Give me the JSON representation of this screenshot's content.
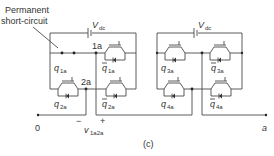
{
  "annotation": {
    "line1": "Permanent",
    "line2": "short-circuit"
  },
  "left_bridge": {
    "source_label": "V",
    "source_sub": "dc",
    "node_top": "1a",
    "node_mid": "2a",
    "switches": [
      {
        "label": "q",
        "sub": "1a",
        "bar": false
      },
      {
        "label": "q",
        "sub": "1a",
        "bar": true
      },
      {
        "label": "q",
        "sub": "2a",
        "bar": false
      },
      {
        "label": "q",
        "sub": "2a",
        "bar": true
      }
    ]
  },
  "right_bridge": {
    "source_label": "V",
    "source_sub": "dc",
    "switches": [
      {
        "label": "q",
        "sub": "3a",
        "bar": false
      },
      {
        "label": "q",
        "sub": "3a",
        "bar": true
      },
      {
        "label": "q",
        "sub": "4a",
        "bar": false
      },
      {
        "label": "q",
        "sub": "4a",
        "bar": true
      }
    ]
  },
  "terminals": {
    "left": "0",
    "right": "a"
  },
  "voltage": {
    "minus": "−",
    "plus": "+",
    "label": "v",
    "sub": "1a2a"
  },
  "caption": "(c)"
}
